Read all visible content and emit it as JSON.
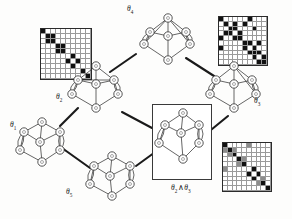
{
  "figure": {
    "background": "#fdfdfc",
    "line_color": "#1a1a1a",
    "node_fill": "#ffffff",
    "cell_on_color": "#111111",
    "cell_mid_color": "#8c8c8c",
    "cell_off_color": "#ffffff"
  },
  "labels": {
    "theta1": "θ",
    "theta1_sub": "1",
    "theta2": "θ",
    "theta2_sub": "2",
    "theta3": "θ",
    "theta3_sub": "3",
    "theta4": "θ",
    "theta4_sub": "4",
    "theta5": "θ",
    "theta5_sub": "5",
    "meet": "θ",
    "meet_sub_a": "2",
    "meet_op": "∧",
    "meet_b": "θ",
    "meet_sub_b": "3"
  },
  "nodes": [
    {
      "id": "theta4",
      "name": "graph-theta4",
      "label_ref": "theta4",
      "x": 140,
      "y": 14,
      "w": 56,
      "h": 54,
      "boxed": false
    },
    {
      "id": "theta2",
      "name": "graph-theta2",
      "label_ref": "theta2",
      "x": 68,
      "y": 62,
      "w": 56,
      "h": 54,
      "boxed": false
    },
    {
      "id": "theta3",
      "name": "graph-theta3",
      "label_ref": "theta3",
      "x": 206,
      "y": 62,
      "w": 56,
      "h": 54,
      "boxed": false
    },
    {
      "id": "theta1",
      "name": "graph-theta1",
      "label_ref": "theta1",
      "x": 14,
      "y": 116,
      "w": 56,
      "h": 54,
      "boxed": false
    },
    {
      "id": "theta5",
      "name": "graph-theta5",
      "label_ref": "theta5",
      "x": 84,
      "y": 150,
      "w": 56,
      "h": 54,
      "boxed": false
    },
    {
      "id": "meet",
      "name": "graph-meet",
      "label_ref": "meet",
      "x": 152,
      "y": 104,
      "w": 58,
      "h": 74,
      "boxed": true
    }
  ],
  "lattice_edges": [
    {
      "from": "theta2",
      "to": "theta4"
    },
    {
      "from": "theta4",
      "to": "theta3"
    },
    {
      "from": "theta1",
      "to": "theta2"
    },
    {
      "from": "theta1",
      "to": "theta5"
    },
    {
      "from": "theta5",
      "to": "meet"
    },
    {
      "from": "theta3",
      "to": "meet"
    },
    {
      "from": "theta2",
      "to": "meet"
    }
  ],
  "matrices": [
    {
      "name": "matrix-block-diagonal",
      "x": 40,
      "y": 28,
      "size": 50,
      "n": 10,
      "description": "block-diagonal adjacency matrix",
      "grid": [
        [
          1,
          0,
          0,
          0,
          0,
          0,
          0,
          0,
          0,
          0
        ],
        [
          0,
          1,
          1,
          0,
          0,
          0,
          0,
          0,
          0,
          0
        ],
        [
          0,
          1,
          1,
          0,
          0,
          0,
          0,
          0,
          0,
          0
        ],
        [
          0,
          0,
          0,
          1,
          1,
          0,
          0,
          0,
          0,
          0
        ],
        [
          0,
          0,
          0,
          1,
          1,
          0,
          0,
          0,
          0,
          0
        ],
        [
          0,
          0,
          0,
          0,
          0,
          0,
          1,
          0,
          0,
          0
        ],
        [
          0,
          0,
          0,
          0,
          0,
          1,
          0,
          1,
          0,
          0
        ],
        [
          0,
          0,
          0,
          0,
          0,
          0,
          1,
          0,
          0,
          0
        ],
        [
          0,
          0,
          0,
          0,
          0,
          0,
          0,
          0,
          1,
          0
        ],
        [
          0,
          0,
          0,
          0,
          0,
          0,
          0,
          0,
          0,
          1
        ]
      ]
    },
    {
      "name": "matrix-sparse-scattered",
      "x": 218,
      "y": 16,
      "size": 48,
      "n": 10,
      "description": "sparse scattered adjacency matrix",
      "grid": [
        [
          1,
          0,
          0,
          0,
          0,
          0,
          1,
          0,
          0,
          0
        ],
        [
          0,
          1,
          0,
          1,
          0,
          1,
          0,
          0,
          0,
          0
        ],
        [
          0,
          0,
          1,
          1,
          0,
          0,
          0,
          1,
          0,
          0
        ],
        [
          0,
          1,
          1,
          0,
          1,
          0,
          0,
          0,
          0,
          0
        ],
        [
          1,
          0,
          0,
          1,
          1,
          0,
          0,
          0,
          0,
          0
        ],
        [
          0,
          0,
          0,
          0,
          0,
          1,
          1,
          0,
          1,
          0
        ],
        [
          1,
          0,
          0,
          0,
          0,
          1,
          0,
          1,
          0,
          0
        ],
        [
          0,
          0,
          0,
          0,
          0,
          0,
          1,
          1,
          1,
          0
        ],
        [
          0,
          0,
          0,
          0,
          0,
          0,
          0,
          1,
          0,
          1
        ],
        [
          0,
          0,
          0,
          0,
          0,
          0,
          0,
          0,
          1,
          1
        ]
      ]
    },
    {
      "name": "matrix-intersection",
      "x": 222,
      "y": 142,
      "size": 48,
      "n": 10,
      "description": "intersection adjacency matrix with shared (gray) entries",
      "grid": [
        [
          1,
          0,
          0,
          0,
          0,
          2,
          0,
          0,
          0,
          0
        ],
        [
          2,
          1,
          2,
          0,
          0,
          0,
          0,
          0,
          0,
          0
        ],
        [
          0,
          2,
          1,
          0,
          0,
          0,
          0,
          0,
          0,
          0
        ],
        [
          0,
          0,
          0,
          1,
          2,
          0,
          0,
          0,
          0,
          0
        ],
        [
          0,
          0,
          0,
          2,
          1,
          0,
          0,
          0,
          0,
          0
        ],
        [
          2,
          0,
          0,
          0,
          0,
          0,
          1,
          0,
          0,
          0
        ],
        [
          0,
          0,
          0,
          0,
          0,
          1,
          0,
          1,
          0,
          0
        ],
        [
          0,
          0,
          0,
          0,
          0,
          0,
          1,
          0,
          2,
          0
        ],
        [
          0,
          0,
          0,
          0,
          0,
          0,
          0,
          2,
          1,
          0
        ],
        [
          0,
          0,
          0,
          0,
          0,
          0,
          0,
          0,
          0,
          1
        ]
      ]
    }
  ],
  "graph_models": {
    "theta4": {
      "nodes": [
        [
          28,
          4
        ],
        [
          10,
          18
        ],
        [
          46,
          18
        ],
        [
          28,
          22
        ],
        [
          4,
          30
        ],
        [
          50,
          30
        ],
        [
          28,
          46
        ]
      ],
      "edges": [
        [
          0,
          1
        ],
        [
          0,
          2
        ],
        [
          0,
          3
        ],
        [
          1,
          3
        ],
        [
          2,
          3
        ],
        [
          1,
          4
        ],
        [
          2,
          5
        ],
        [
          3,
          6
        ],
        [
          4,
          6
        ],
        [
          5,
          6
        ],
        [
          0,
          4
        ],
        [
          0,
          5
        ]
      ]
    },
    "theta2": {
      "nodes": [
        [
          28,
          4
        ],
        [
          10,
          18
        ],
        [
          46,
          18
        ],
        [
          28,
          22
        ],
        [
          4,
          32
        ],
        [
          50,
          32
        ],
        [
          28,
          46
        ]
      ],
      "edges": [
        [
          0,
          1
        ],
        [
          0,
          2
        ],
        [
          0,
          3
        ],
        [
          1,
          3
        ],
        [
          2,
          3
        ],
        [
          1,
          4
        ],
        [
          2,
          5
        ],
        [
          3,
          6
        ],
        [
          4,
          6
        ],
        [
          5,
          6
        ],
        [
          1,
          2
        ]
      ]
    },
    "theta3": {
      "nodes": [
        [
          28,
          4
        ],
        [
          10,
          18
        ],
        [
          46,
          18
        ],
        [
          28,
          22
        ],
        [
          4,
          32
        ],
        [
          50,
          32
        ],
        [
          28,
          46
        ]
      ],
      "edges": [
        [
          0,
          1
        ],
        [
          0,
          2
        ],
        [
          0,
          3
        ],
        [
          1,
          3
        ],
        [
          2,
          3
        ],
        [
          1,
          4
        ],
        [
          2,
          5
        ],
        [
          3,
          6
        ],
        [
          4,
          6
        ],
        [
          5,
          6
        ],
        [
          0,
          5
        ]
      ]
    },
    "theta1": {
      "nodes": [
        [
          28,
          6
        ],
        [
          10,
          16
        ],
        [
          46,
          16
        ],
        [
          26,
          26
        ],
        [
          6,
          34
        ],
        [
          46,
          34
        ],
        [
          28,
          46
        ]
      ],
      "edges": [
        [
          0,
          1
        ],
        [
          0,
          2
        ],
        [
          1,
          3
        ],
        [
          2,
          3
        ],
        [
          1,
          4
        ],
        [
          2,
          5
        ],
        [
          3,
          6
        ],
        [
          4,
          6
        ],
        [
          5,
          6
        ],
        [
          0,
          3
        ]
      ]
    },
    "theta5": {
      "nodes": [
        [
          28,
          6
        ],
        [
          10,
          16
        ],
        [
          46,
          16
        ],
        [
          26,
          26
        ],
        [
          6,
          34
        ],
        [
          46,
          34
        ],
        [
          28,
          46
        ]
      ],
      "edges": [
        [
          0,
          1
        ],
        [
          0,
          2
        ],
        [
          1,
          3
        ],
        [
          2,
          3
        ],
        [
          1,
          4
        ],
        [
          2,
          5
        ],
        [
          3,
          6
        ],
        [
          4,
          6
        ],
        [
          5,
          6
        ],
        [
          0,
          3
        ]
      ]
    },
    "meet": {
      "nodes": [
        [
          30,
          8
        ],
        [
          12,
          20
        ],
        [
          46,
          20
        ],
        [
          28,
          28
        ],
        [
          6,
          38
        ],
        [
          46,
          38
        ],
        [
          30,
          54
        ]
      ],
      "edges": [
        [
          0,
          1
        ],
        [
          0,
          2
        ],
        [
          1,
          3
        ],
        [
          2,
          3
        ],
        [
          1,
          4
        ],
        [
          2,
          5
        ],
        [
          3,
          6
        ],
        [
          4,
          6
        ],
        [
          5,
          6
        ],
        [
          0,
          3
        ]
      ]
    }
  }
}
